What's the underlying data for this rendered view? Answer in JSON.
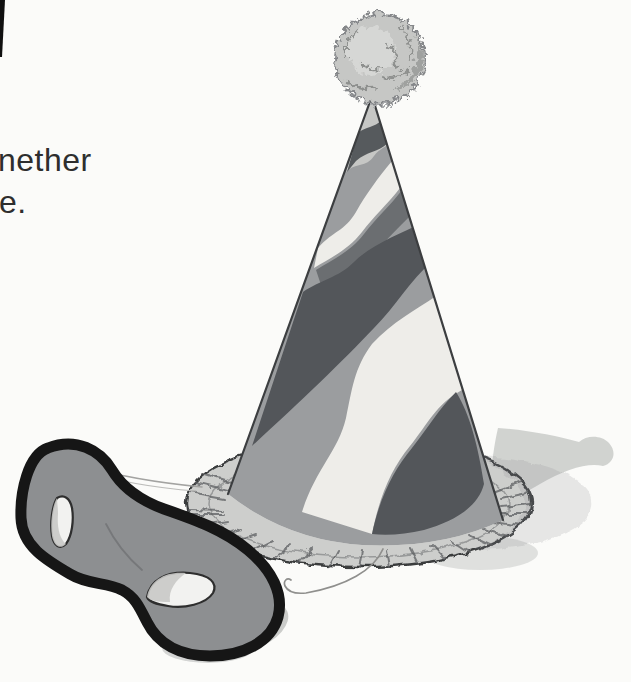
{
  "page": {
    "background_color": "#fbfbf9",
    "text_fragments": [
      {
        "text": "nether"
      },
      {
        "text": "e."
      }
    ]
  },
  "illustration": {
    "subject": "striped party hat with pom-pom and ruffled brim, gray eye mask in front",
    "colors": {
      "stripe_dark": "#53565a",
      "stripe_medium": "#9b9d9f",
      "stripe_light": "#eeede9",
      "cone_tip": "#c6c7c5",
      "ruffle": "#cdcecc",
      "pom_pom": "#c6c7c5",
      "mask_fill": "#8d8f91",
      "mask_outline": "#161616",
      "eye_hole": "#f2f2f0",
      "shadow": "#c9cbc9",
      "string": "#9b9b99",
      "page_edge_mark": "#101010"
    }
  }
}
